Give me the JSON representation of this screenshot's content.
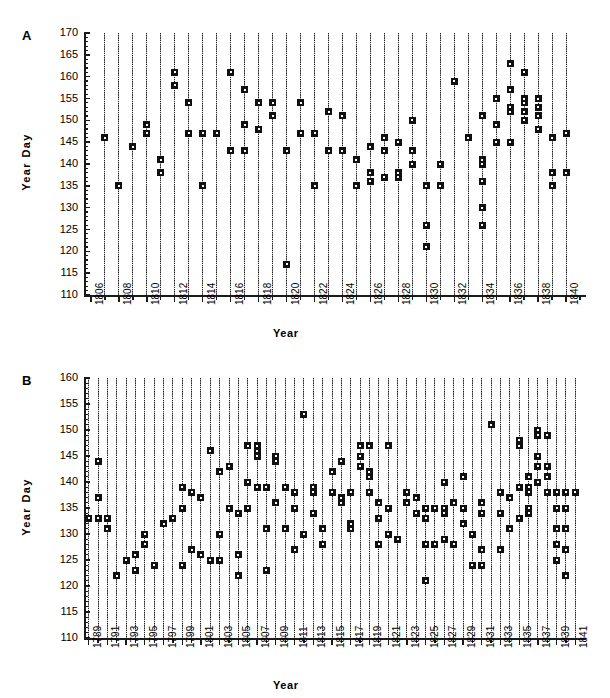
{
  "figure": {
    "background": "#ffffff",
    "ink_color": "#101010"
  },
  "panels": [
    {
      "id": "A",
      "letter": "A",
      "ylabel": "Year  Day",
      "xlabel": "Year"
    },
    {
      "id": "B",
      "letter": "B",
      "ylabel": "Year  Day",
      "xlabel": "Year"
    }
  ],
  "chart_data": [
    {
      "type": "scatter",
      "panel": "A",
      "title": "",
      "xlabel": "Year",
      "ylabel": "Year Day",
      "xlim": [
        1805.5,
        1841.0
      ],
      "ylim": [
        110,
        170
      ],
      "ytick_step": 5,
      "ytick_minor_step": 1,
      "yticks": [
        110,
        115,
        120,
        125,
        130,
        135,
        140,
        145,
        150,
        155,
        160,
        165,
        170
      ],
      "ytick_labels": [
        "110",
        "115",
        "120",
        "125",
        "130",
        "135",
        "140",
        "145",
        "150",
        "155",
        "160",
        "165",
        "170"
      ],
      "xticks": [
        1806,
        1808,
        1810,
        1812,
        1814,
        1816,
        1818,
        1820,
        1822,
        1824,
        1826,
        1828,
        1830,
        1832,
        1834,
        1836,
        1838,
        1840
      ],
      "xtick_labels": [
        "1806",
        "1808",
        "1810",
        "1812",
        "1814",
        "1816",
        "1818",
        "1820",
        "1822",
        "1824",
        "1826",
        "1828",
        "1830",
        "1832",
        "1834",
        "1836",
        "1838",
        "1840"
      ],
      "xtick_minor_step": 1,
      "grid": false,
      "stems": true,
      "stem_top": 170,
      "points": [
        {
          "x": 1807,
          "y": [
            146
          ]
        },
        {
          "x": 1808,
          "y": [
            135
          ]
        },
        {
          "x": 1809,
          "y": [
            144
          ]
        },
        {
          "x": 1810,
          "y": [
            147,
            149
          ]
        },
        {
          "x": 1811,
          "y": [
            138,
            141
          ]
        },
        {
          "x": 1812,
          "y": [
            158,
            161
          ]
        },
        {
          "x": 1813,
          "y": [
            147,
            154
          ]
        },
        {
          "x": 1814,
          "y": [
            135,
            147
          ]
        },
        {
          "x": 1815,
          "y": [
            147
          ]
        },
        {
          "x": 1816,
          "y": [
            143,
            161
          ]
        },
        {
          "x": 1817,
          "y": [
            143,
            149,
            157
          ]
        },
        {
          "x": 1818,
          "y": [
            148,
            154
          ]
        },
        {
          "x": 1819,
          "y": [
            151,
            154
          ]
        },
        {
          "x": 1820,
          "y": [
            117,
            143
          ]
        },
        {
          "x": 1821,
          "y": [
            147,
            154
          ]
        },
        {
          "x": 1822,
          "y": [
            135,
            147
          ]
        },
        {
          "x": 1823,
          "y": [
            143,
            152
          ]
        },
        {
          "x": 1824,
          "y": [
            143,
            151
          ]
        },
        {
          "x": 1825,
          "y": [
            135,
            141
          ]
        },
        {
          "x": 1826,
          "y": [
            136,
            138,
            144
          ]
        },
        {
          "x": 1827,
          "y": [
            137,
            143,
            146
          ]
        },
        {
          "x": 1828,
          "y": [
            137,
            138,
            145
          ]
        },
        {
          "x": 1829,
          "y": [
            140,
            143,
            150
          ]
        },
        {
          "x": 1830,
          "y": [
            121,
            126,
            135
          ]
        },
        {
          "x": 1831,
          "y": [
            135,
            140
          ]
        },
        {
          "x": 1832,
          "y": [
            159
          ]
        },
        {
          "x": 1833,
          "y": [
            146
          ]
        },
        {
          "x": 1834,
          "y": [
            126,
            130,
            136,
            140,
            141,
            151
          ]
        },
        {
          "x": 1835,
          "y": [
            145,
            149,
            155
          ]
        },
        {
          "x": 1836,
          "y": [
            145,
            152,
            153,
            157,
            163
          ]
        },
        {
          "x": 1837,
          "y": [
            150,
            152,
            154,
            155,
            161
          ]
        },
        {
          "x": 1838,
          "y": [
            148,
            151,
            153,
            155
          ]
        },
        {
          "x": 1839,
          "y": [
            135,
            138,
            146
          ]
        },
        {
          "x": 1840,
          "y": [
            138,
            147
          ]
        }
      ]
    },
    {
      "type": "scatter",
      "panel": "B",
      "title": "",
      "xlabel": "Year",
      "ylabel": "Year Day",
      "xlim": [
        1788.5,
        1841.5
      ],
      "ylim": [
        110,
        160
      ],
      "ytick_step": 5,
      "ytick_minor_step": 1,
      "yticks": [
        110,
        115,
        120,
        125,
        130,
        135,
        140,
        145,
        150,
        155,
        160
      ],
      "ytick_labels": [
        "110",
        "115",
        "120",
        "125",
        "130",
        "135",
        "140",
        "145",
        "150",
        "155",
        "160"
      ],
      "xticks": [
        1789,
        1791,
        1793,
        1795,
        1797,
        1799,
        1801,
        1803,
        1805,
        1807,
        1809,
        1811,
        1813,
        1815,
        1817,
        1819,
        1821,
        1823,
        1825,
        1827,
        1829,
        1831,
        1833,
        1835,
        1837,
        1839,
        1841
      ],
      "xtick_labels": [
        "1789",
        "1791",
        "1793",
        "1795",
        "1797",
        "1799",
        "1801",
        "1803",
        "1805",
        "1807",
        "1809",
        "1811",
        "1813",
        "1815",
        "1817",
        "1819",
        "1821",
        "1823",
        "1825",
        "1827",
        "1829",
        "1831",
        "1833",
        "1835",
        "1837",
        "1839",
        "1841"
      ],
      "xtick_minor_step": 1,
      "grid": false,
      "stems": true,
      "stem_top": 160,
      "points": [
        {
          "x": 1789,
          "y": [
            133
          ]
        },
        {
          "x": 1790,
          "y": [
            133,
            137,
            144
          ]
        },
        {
          "x": 1791,
          "y": [
            131,
            133
          ]
        },
        {
          "x": 1792,
          "y": [
            122
          ]
        },
        {
          "x": 1793,
          "y": [
            125
          ]
        },
        {
          "x": 1794,
          "y": [
            123,
            126
          ]
        },
        {
          "x": 1795,
          "y": [
            128,
            130
          ]
        },
        {
          "x": 1796,
          "y": [
            124
          ]
        },
        {
          "x": 1797,
          "y": [
            132
          ]
        },
        {
          "x": 1798,
          "y": [
            133
          ]
        },
        {
          "x": 1799,
          "y": [
            124,
            135,
            139
          ]
        },
        {
          "x": 1800,
          "y": [
            127,
            138
          ]
        },
        {
          "x": 1801,
          "y": [
            126,
            137
          ]
        },
        {
          "x": 1802,
          "y": [
            125,
            146
          ]
        },
        {
          "x": 1803,
          "y": [
            125,
            130,
            142
          ]
        },
        {
          "x": 1804,
          "y": [
            135,
            143
          ]
        },
        {
          "x": 1805,
          "y": [
            122,
            126,
            134
          ]
        },
        {
          "x": 1806,
          "y": [
            135,
            140,
            147
          ]
        },
        {
          "x": 1807,
          "y": [
            139,
            145,
            146,
            147
          ]
        },
        {
          "x": 1808,
          "y": [
            123,
            131,
            139
          ]
        },
        {
          "x": 1809,
          "y": [
            136,
            144,
            145
          ]
        },
        {
          "x": 1810,
          "y": [
            131,
            139
          ]
        },
        {
          "x": 1811,
          "y": [
            127,
            135,
            138
          ]
        },
        {
          "x": 1812,
          "y": [
            130,
            153
          ]
        },
        {
          "x": 1813,
          "y": [
            134,
            138,
            139
          ]
        },
        {
          "x": 1814,
          "y": [
            128,
            131
          ]
        },
        {
          "x": 1815,
          "y": [
            138,
            142
          ]
        },
        {
          "x": 1816,
          "y": [
            136,
            137,
            144
          ]
        },
        {
          "x": 1817,
          "y": [
            131,
            132,
            138
          ]
        },
        {
          "x": 1818,
          "y": [
            143,
            145,
            147
          ]
        },
        {
          "x": 1819,
          "y": [
            138,
            141,
            142,
            147
          ]
        },
        {
          "x": 1820,
          "y": [
            128,
            133,
            136
          ]
        },
        {
          "x": 1821,
          "y": [
            130,
            135,
            147
          ]
        },
        {
          "x": 1822,
          "y": [
            129
          ]
        },
        {
          "x": 1823,
          "y": [
            136,
            138
          ]
        },
        {
          "x": 1824,
          "y": [
            134,
            137
          ]
        },
        {
          "x": 1825,
          "y": [
            121,
            128,
            133,
            135
          ]
        },
        {
          "x": 1826,
          "y": [
            128,
            135
          ]
        },
        {
          "x": 1827,
          "y": [
            129,
            134,
            135,
            140
          ]
        },
        {
          "x": 1828,
          "y": [
            128,
            128,
            136
          ]
        },
        {
          "x": 1829,
          "y": [
            132,
            135,
            141
          ]
        },
        {
          "x": 1830,
          "y": [
            124,
            130
          ]
        },
        {
          "x": 1831,
          "y": [
            124,
            127,
            134,
            136
          ]
        },
        {
          "x": 1832,
          "y": [
            151
          ]
        },
        {
          "x": 1833,
          "y": [
            127,
            134,
            138
          ]
        },
        {
          "x": 1834,
          "y": [
            131,
            137
          ]
        },
        {
          "x": 1835,
          "y": [
            133,
            139,
            147,
            148
          ]
        },
        {
          "x": 1836,
          "y": [
            134,
            135,
            138,
            139,
            141
          ]
        },
        {
          "x": 1837,
          "y": [
            140,
            143,
            145,
            149,
            150
          ]
        },
        {
          "x": 1838,
          "y": [
            138,
            141,
            143,
            149
          ]
        },
        {
          "x": 1839,
          "y": [
            125,
            128,
            131,
            135,
            138
          ]
        },
        {
          "x": 1840,
          "y": [
            122,
            127,
            131,
            135,
            138
          ]
        },
        {
          "x": 1841,
          "y": [
            138
          ]
        }
      ]
    }
  ]
}
